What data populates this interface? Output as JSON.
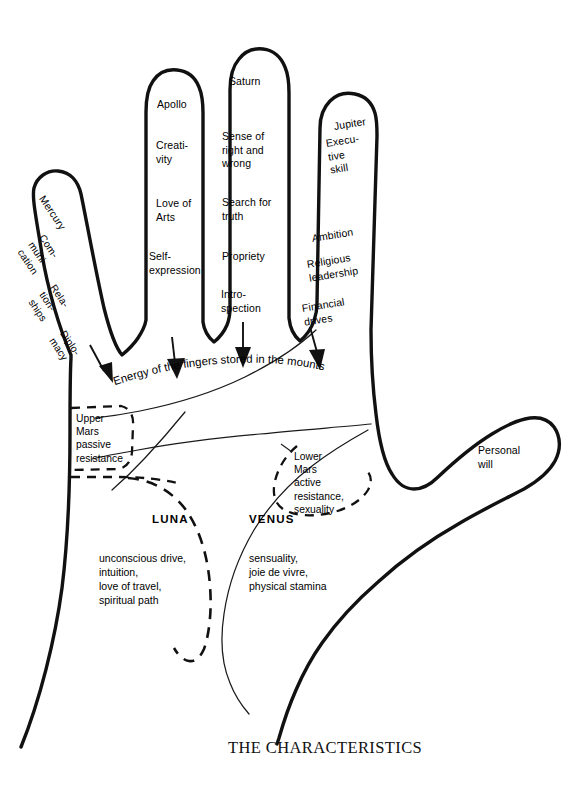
{
  "title": "THE CHARACTERISTICS",
  "diagram": {
    "flow_note": "Energy of the fingers stored in the mounts"
  },
  "fingers": [
    {
      "id": "mercury",
      "name": "Mercury",
      "traits": [
        "Com-\nmuni-\ncation",
        "Rela-\ntion-\nships",
        "Diplo-\nmacy"
      ]
    },
    {
      "id": "apollo",
      "name": "Apollo",
      "traits": [
        "Creati-\nvity",
        "Love of\nArts",
        "Self-\nexpression"
      ]
    },
    {
      "id": "saturn",
      "name": "Saturn",
      "traits": [
        "Sense of\nright and\nwrong",
        "Search for\ntruth",
        "Propriety",
        "Intro-\nspection"
      ]
    },
    {
      "id": "jupiter",
      "name": "Jupiter",
      "traits": [
        "Execu-\ntive\nskill",
        "Ambition",
        "Religious\nleadership",
        "Financial\ndrives"
      ]
    }
  ],
  "thumb": {
    "label": "Personal\nwill"
  },
  "mars": {
    "upper": "Upper\nMars\npassive\nresistance",
    "lower": "Lower\nMars\nactive\nresistance,\nsexuality"
  },
  "mounts": [
    {
      "id": "luna",
      "name": "LUNA",
      "description": "unconscious drive,\nintuition,\nlove of travel,\nspiritual path"
    },
    {
      "id": "venus",
      "name": "VENUS",
      "description": "sensuality,\njoie de vivre,\nphysical stamina"
    }
  ],
  "colors": {
    "ink": "#111111",
    "background": "#ffffff",
    "thin_line": "#1a1a1a"
  }
}
